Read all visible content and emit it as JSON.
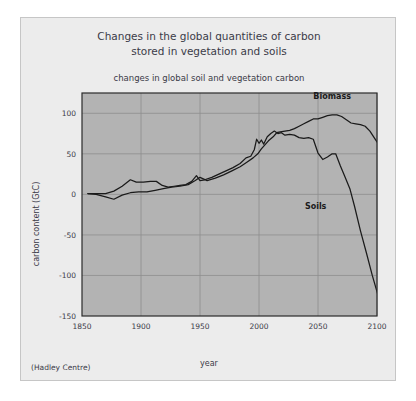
{
  "card": {
    "credit": "(Hadley Centre)"
  },
  "chart_data": {
    "type": "line",
    "title": "Changes in the global quantities of carbon",
    "title_line2": "stored in vegetation and soils",
    "subtitle": "changes in global soil and vegetation carbon",
    "xlabel": "year",
    "ylabel": "carbon content (GtC)",
    "xlim": [
      1850,
      2100
    ],
    "ylim": [
      -150,
      125
    ],
    "xticks": [
      1850,
      1900,
      1950,
      2000,
      2050,
      2100
    ],
    "xticklabels": [
      "1850",
      "1900",
      "1950",
      "2000",
      "2050",
      "2100"
    ],
    "yticks": [
      100,
      50,
      0,
      -50,
      -100,
      -150
    ],
    "yticklabels": [
      "100",
      "50",
      "0",
      "-50",
      "-100",
      "-150"
    ],
    "grid": true,
    "legend_position": "inline-annotations",
    "annotations": [
      {
        "text": "Biomass",
        "x": 2062,
        "y": 118
      },
      {
        "text": "Soils",
        "x": 2048,
        "y": -18
      }
    ],
    "series": [
      {
        "name": "Biomass",
        "color": "#1a1a1a",
        "x": [
          1855,
          1862,
          1870,
          1877,
          1884,
          1891,
          1898,
          1905,
          1912,
          1919,
          1926,
          1933,
          1940,
          1946,
          1950,
          1956,
          1963,
          1970,
          1977,
          1984,
          1990,
          1995,
          1999,
          2002,
          2005,
          2008,
          2012,
          2015,
          2018,
          2022,
          2026,
          2030,
          2034,
          2038,
          2042,
          2046,
          2050,
          2054,
          2058,
          2062,
          2066,
          2070,
          2074,
          2078,
          2082,
          2086,
          2090,
          2094,
          2098,
          2103
        ],
        "y": [
          1,
          0,
          -3,
          -6,
          -1,
          2,
          3,
          3,
          5,
          7,
          9,
          10,
          12,
          17,
          21,
          17,
          20,
          24,
          29,
          34,
          40,
          45,
          50,
          56,
          61,
          66,
          71,
          76,
          77,
          78,
          79,
          81,
          84,
          87,
          90,
          93,
          93,
          95,
          97,
          98,
          98,
          96,
          92,
          88,
          87,
          86,
          84,
          78,
          69,
          58
        ]
      },
      {
        "name": "Soils",
        "color": "#1a1a1a",
        "x": [
          1855,
          1862,
          1870,
          1877,
          1884,
          1891,
          1896,
          1902,
          1908,
          1913,
          1918,
          1923,
          1928,
          1933,
          1938,
          1943,
          1947,
          1950,
          1954,
          1960,
          1966,
          1972,
          1978,
          1984,
          1989,
          1993,
          1996,
          1998,
          2000,
          2002,
          2004,
          2007,
          2010,
          2013,
          2016,
          2019,
          2022,
          2026,
          2030,
          2034,
          2038,
          2042,
          2046,
          2050,
          2054,
          2058,
          2062,
          2065,
          2069,
          2073,
          2077,
          2081,
          2086,
          2091,
          2096,
          2103
        ],
        "y": [
          1,
          1,
          1,
          4,
          10,
          18,
          15,
          15,
          16,
          16,
          11,
          9,
          10,
          11,
          12,
          16,
          23,
          17,
          18,
          21,
          25,
          29,
          33,
          38,
          45,
          47,
          55,
          68,
          63,
          67,
          62,
          71,
          75,
          78,
          75,
          76,
          73,
          74,
          73,
          70,
          69,
          70,
          68,
          51,
          43,
          46,
          50,
          50,
          35,
          21,
          7,
          -15,
          -45,
          -72,
          -100,
          -135
        ]
      }
    ]
  }
}
